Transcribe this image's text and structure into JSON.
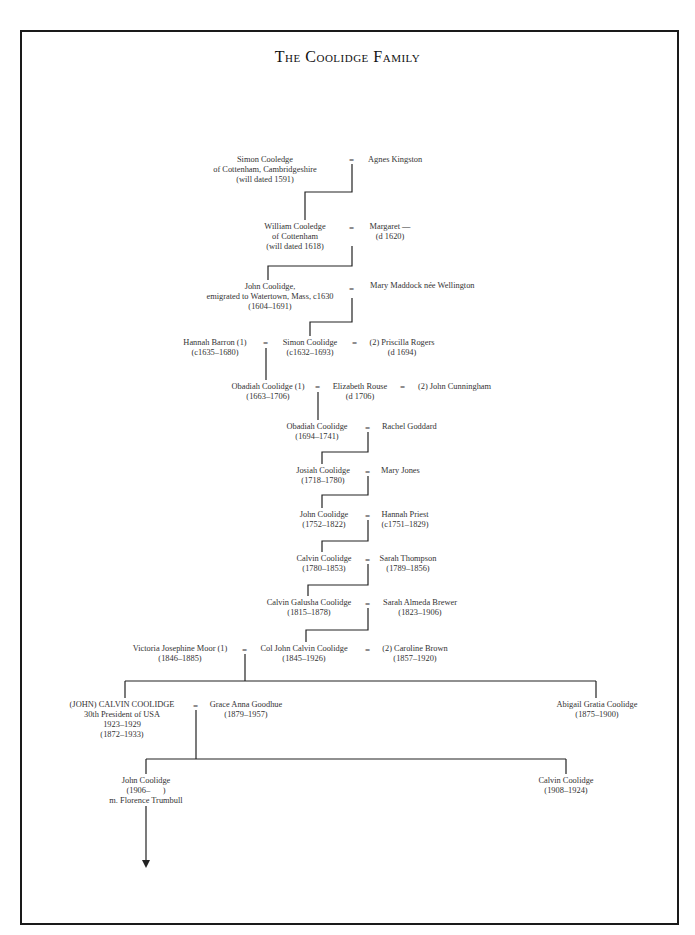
{
  "title": "The Coolidge Family",
  "equals": "=",
  "generations": {
    "g1": {
      "husband": {
        "name": "Simon Cooledge",
        "line2": "of Cottenham, Cambridgeshire",
        "line3": "(will dated 1591)"
      },
      "wife": {
        "name": "Agnes Kingston"
      }
    },
    "g2": {
      "husband": {
        "name": "William Cooledge",
        "line2": "of Cottenham",
        "line3": "(will dated 1618)"
      },
      "wife": {
        "name": "Margaret —",
        "line2": "(d 1620)"
      }
    },
    "g3": {
      "husband": {
        "name": "John Coolidge,",
        "line2": "emigrated to Watertown, Mass, c1630",
        "line3": "(1604–1691)"
      },
      "wife": {
        "name": "Mary Maddock née Wellington"
      }
    },
    "g4": {
      "wife1": {
        "name": "Hannah Barron (1)",
        "line2": "(c1635–1680)"
      },
      "husband": {
        "name": "Simon Coolidge",
        "line2": "(c1632–1693)"
      },
      "wife2": {
        "name": "(2) Priscilla Rogers",
        "line2": "(d 1694)"
      }
    },
    "g5": {
      "husband": {
        "name": "Obadiah Coolidge (1)",
        "line2": "(1663–1706)"
      },
      "wife": {
        "name": "Elizabeth Rouse",
        "line2": "(d 1706)"
      },
      "wife_husband2": {
        "name": "(2) John Cunningham"
      }
    },
    "g6": {
      "husband": {
        "name": "Obadiah Coolidge",
        "line2": "(1694–1741)"
      },
      "wife": {
        "name": "Rachel Goddard"
      }
    },
    "g7": {
      "husband": {
        "name": "Josiah Coolidge",
        "line2": "(1718–1780)"
      },
      "wife": {
        "name": "Mary Jones"
      }
    },
    "g8": {
      "husband": {
        "name": "John Coolidge",
        "line2": "(1752–1822)"
      },
      "wife": {
        "name": "Hannah Priest",
        "line2": "(c1751–1829)"
      }
    },
    "g9": {
      "husband": {
        "name": "Calvin Coolidge",
        "line2": "(1780–1853)"
      },
      "wife": {
        "name": "Sarah Thompson",
        "line2": "(1789–1856)"
      }
    },
    "g10": {
      "husband": {
        "name": "Calvin Galusha Coolidge",
        "line2": "(1815–1878)"
      },
      "wife": {
        "name": "Sarah Almeda Brewer",
        "line2": "(1823–1906)"
      }
    },
    "g11": {
      "wife1": {
        "name": "Victoria Josephine Moor (1)",
        "line2": "(1846–1885)"
      },
      "husband": {
        "name": "Col John Calvin Coolidge",
        "line2": "(1845–1926)"
      },
      "wife2": {
        "name": "(2) Caroline Brown",
        "line2": "(1857–1920)"
      }
    },
    "g12": {
      "president": {
        "name": "(JOHN) CALVIN COOLIDGE",
        "line2": "30th President of USA",
        "line3": "1923–1929",
        "line4": "(1872–1933)"
      },
      "wife": {
        "name": "Grace Anna Goodhue",
        "line2": "(1879–1957)"
      },
      "sister": {
        "name": "Abigail Gratia Coolidge",
        "line2": "(1875–1900)"
      }
    },
    "g13": {
      "son1": {
        "name": "John Coolidge",
        "line2": "(1906–      )",
        "line3": "m. Florence Trumbull"
      },
      "son2": {
        "name": "Calvin Coolidge",
        "line2": "(1908–1924)"
      }
    }
  }
}
